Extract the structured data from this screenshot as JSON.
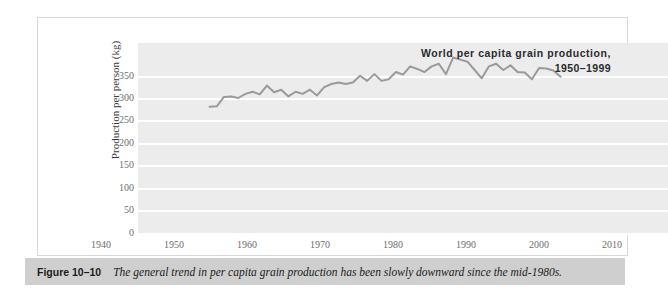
{
  "figure": {
    "caption_label": "Figure 10–10",
    "caption_text": "The general trend in per capita grain production has been slowly downward since the mid-1980s."
  },
  "colors": {
    "panel_background": "#ececed",
    "gridline": "#ffffff",
    "series_line": "#9a9a9a",
    "caption_band": "#cfcfcf",
    "tick_text": "#6e6e6e",
    "title_text": "#2b2b2b"
  },
  "chart_data": {
    "type": "line",
    "title": "World per capita grain production,",
    "subtitle": "1950–1999",
    "xlabel": "Year",
    "ylabel": "Production per person (kg)",
    "xlim": [
      1940,
      2014
    ],
    "ylim": [
      0,
      370
    ],
    "xticks": [
      1940,
      1950,
      1960,
      1970,
      1980,
      1990,
      2000,
      2010
    ],
    "yticks": [
      0,
      50,
      100,
      150,
      200,
      250,
      300,
      350
    ],
    "grid": "horizontal",
    "legend": "none",
    "series": [
      {
        "name": "World per capita grain production",
        "x": [
          1950,
          1951,
          1952,
          1953,
          1954,
          1955,
          1956,
          1957,
          1958,
          1959,
          1960,
          1961,
          1962,
          1963,
          1964,
          1965,
          1966,
          1967,
          1968,
          1969,
          1970,
          1971,
          1972,
          1973,
          1974,
          1975,
          1976,
          1977,
          1978,
          1979,
          1980,
          1981,
          1982,
          1983,
          1984,
          1985,
          1986,
          1987,
          1988,
          1989,
          1990,
          1991,
          1992,
          1993,
          1994,
          1995,
          1996,
          1997,
          1998,
          1999
        ],
        "values": [
          247,
          248,
          266,
          267,
          264,
          272,
          276,
          271,
          288,
          275,
          280,
          267,
          276,
          272,
          280,
          269,
          285,
          291,
          294,
          291,
          294,
          307,
          297,
          310,
          297,
          300,
          314,
          309,
          325,
          320,
          314,
          325,
          330,
          310,
          342,
          338,
          334,
          318,
          302,
          325,
          330,
          318,
          327,
          314,
          313,
          300,
          322,
          321,
          317,
          305
        ]
      }
    ]
  }
}
